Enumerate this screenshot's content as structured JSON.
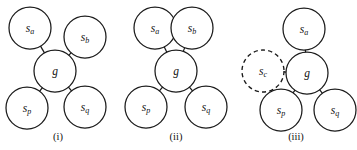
{
  "figure": {
    "background_color": "#ffffff",
    "stroke_color": "#1a1a1a",
    "panels": [
      {
        "id": "panel-i",
        "caption": "(i)",
        "caption_x": 58,
        "caption_y": 140,
        "nodes": [
          {
            "id": "sa",
            "base": "s",
            "sub": "a",
            "label": "s_a",
            "cx": 30,
            "cy": 28,
            "r": 21,
            "style": "solid"
          },
          {
            "id": "sb",
            "base": "s",
            "sub": "b",
            "label": "s_b",
            "cx": 85,
            "cy": 37,
            "r": 21,
            "style": "solid"
          },
          {
            "id": "g",
            "base": "g",
            "sub": "",
            "label": "g",
            "cx": 55,
            "cy": 71,
            "r": 21,
            "style": "solid"
          },
          {
            "id": "sp",
            "base": "s",
            "sub": "p",
            "label": "s_p",
            "cx": 27,
            "cy": 108,
            "r": 21,
            "style": "solid"
          },
          {
            "id": "sq",
            "base": "s",
            "sub": "q",
            "label": "s_q",
            "cx": 85,
            "cy": 107,
            "r": 21,
            "style": "solid"
          }
        ],
        "edges": [
          {
            "from": "sa",
            "to": "g"
          },
          {
            "from": "sb",
            "to": "g"
          },
          {
            "from": "sp",
            "to": "g"
          },
          {
            "from": "sq",
            "to": "g"
          }
        ]
      },
      {
        "id": "panel-ii",
        "caption": "(ii)",
        "caption_x": 176,
        "caption_y": 140,
        "nodes": [
          {
            "id": "sa",
            "base": "s",
            "sub": "a",
            "label": "s_a",
            "cx": 155,
            "cy": 28,
            "r": 21,
            "style": "solid"
          },
          {
            "id": "sb",
            "base": "s",
            "sub": "b",
            "label": "s_b",
            "cx": 192,
            "cy": 28,
            "r": 21,
            "style": "solid"
          },
          {
            "id": "g",
            "base": "g",
            "sub": "",
            "label": "g",
            "cx": 176,
            "cy": 71,
            "r": 21,
            "style": "solid"
          },
          {
            "id": "sp",
            "base": "s",
            "sub": "p",
            "label": "s_p",
            "cx": 146,
            "cy": 107,
            "r": 21,
            "style": "solid"
          },
          {
            "id": "sq",
            "base": "s",
            "sub": "q",
            "label": "s_q",
            "cx": 206,
            "cy": 107,
            "r": 21,
            "style": "solid"
          }
        ],
        "edges": [
          {
            "from": "sa",
            "to": "g"
          },
          {
            "from": "sb",
            "to": "g"
          },
          {
            "from": "sp",
            "to": "g"
          },
          {
            "from": "sq",
            "to": "g"
          }
        ]
      },
      {
        "id": "panel-iii",
        "caption": "(iii)",
        "caption_x": 296,
        "caption_y": 140,
        "nodes": [
          {
            "id": "sa",
            "base": "s",
            "sub": "a",
            "label": "s_a",
            "cx": 304,
            "cy": 29,
            "r": 21,
            "style": "solid"
          },
          {
            "id": "sc",
            "base": "s",
            "sub": "c",
            "label": "s_c",
            "cx": 263,
            "cy": 71,
            "r": 21,
            "style": "dashed"
          },
          {
            "id": "g",
            "base": "g",
            "sub": "",
            "label": "g",
            "cx": 307,
            "cy": 73,
            "r": 21,
            "style": "solid"
          },
          {
            "id": "sp",
            "base": "s",
            "sub": "p",
            "label": "s_p",
            "cx": 281,
            "cy": 110,
            "r": 21,
            "style": "solid"
          },
          {
            "id": "sq",
            "base": "s",
            "sub": "q",
            "label": "s_q",
            "cx": 335,
            "cy": 110,
            "r": 21,
            "style": "solid"
          }
        ],
        "edges": [
          {
            "from": "sa",
            "to": "g"
          },
          {
            "from": "sc",
            "to": "g"
          },
          {
            "from": "sp",
            "to": "g"
          },
          {
            "from": "sq",
            "to": "g"
          }
        ]
      }
    ]
  }
}
